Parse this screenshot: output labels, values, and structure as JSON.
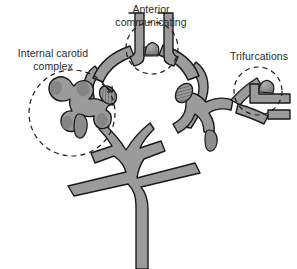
{
  "figure": {
    "background_color": "#ffffff",
    "vessel_fill_color": "#9b9b9b",
    "vessel_stroke_color": "#1a1a1a",
    "aneurysm_shade_color": "#7d7d7d",
    "label_color": "#2b2b2b",
    "dashed_circle_color": "#1a1a1a"
  },
  "labels": {
    "internal_carotid": "Internal carotid\ncomplex",
    "anterior_communicating": "Anterior\ncommunicating",
    "trifurcations": "Trifurcations"
  },
  "annotations": [
    {
      "name": "internal-carotid-complex",
      "label": "Internal carotid\ncomplex",
      "marker": "dashed-circle",
      "center": [
        72,
        113
      ],
      "radius": 43
    },
    {
      "name": "anterior-communicating",
      "label": "Anterior\ncommunicating",
      "marker": "dashed-circle",
      "center": [
        152,
        48
      ],
      "radius": 26
    },
    {
      "name": "trifurcations",
      "label": "Trifurcations",
      "marker": "dashed-circle",
      "center": [
        258,
        91
      ],
      "radius": 24
    }
  ],
  "structures": [
    {
      "name": "basilar-artery-trunk",
      "type": "vessel"
    },
    {
      "name": "circle-of-willis-ring",
      "type": "vessel"
    },
    {
      "name": "anterior-cerebral-arteries",
      "type": "vessel"
    },
    {
      "name": "left-internal-carotid-complex",
      "type": "aneurysm-cluster"
    },
    {
      "name": "left-posterior-communicating-aneurysm",
      "type": "aneurysm-oval"
    },
    {
      "name": "right-posterior-communicating-aneurysm",
      "type": "aneurysm-oval"
    },
    {
      "name": "anterior-communicating-aneurysm",
      "type": "aneurysm-dome"
    },
    {
      "name": "right-trifurcation-aneurysm",
      "type": "aneurysm-dome"
    },
    {
      "name": "posterior-cerebral-arteries",
      "type": "vessel"
    },
    {
      "name": "superior-cerebellar-arteries",
      "type": "vessel"
    }
  ]
}
